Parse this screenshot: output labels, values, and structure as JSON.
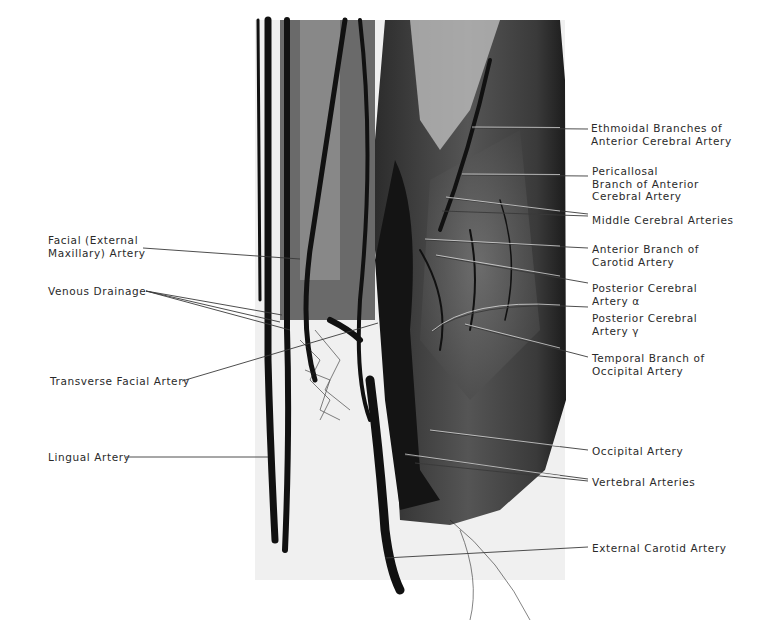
{
  "figure": {
    "labels_left": [
      {
        "id": "facial",
        "lines": [
          "Facial (External",
          "Maxillary) Artery"
        ]
      },
      {
        "id": "venous",
        "lines": [
          "Venous Drainage"
        ]
      },
      {
        "id": "transverse",
        "lines": [
          "Transverse Facial Artery"
        ]
      },
      {
        "id": "lingual",
        "lines": [
          "Lingual Artery"
        ]
      }
    ],
    "labels_right": [
      {
        "id": "ethmoidal",
        "lines": [
          "Ethmoidal Branches of",
          "Anterior Cerebral Artery"
        ]
      },
      {
        "id": "pericallosal",
        "lines": [
          "Pericallosal",
          "Branch of Anterior",
          "Cerebral Artery"
        ]
      },
      {
        "id": "middle",
        "lines": [
          "Middle Cerebral Arteries"
        ]
      },
      {
        "id": "anterior-carotid",
        "lines": [
          "Anterior Branch of",
          "Carotid Artery"
        ]
      },
      {
        "id": "posterior-alpha",
        "lines": [
          "Posterior Cerebral",
          "Artery α"
        ]
      },
      {
        "id": "posterior-gamma",
        "lines": [
          "Posterior Cerebral",
          "Artery γ"
        ]
      },
      {
        "id": "temporal",
        "lines": [
          "Temporal Branch of",
          "Occipital Artery"
        ]
      },
      {
        "id": "occipital",
        "lines": [
          "Occipital Artery"
        ]
      },
      {
        "id": "vertebral",
        "lines": [
          "Vertebral Arteries"
        ]
      },
      {
        "id": "external-carotid",
        "lines": [
          "External Carotid Artery"
        ]
      }
    ]
  }
}
